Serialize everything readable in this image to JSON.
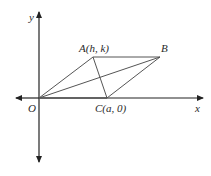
{
  "diagram": {
    "axes": {
      "x_label": "x",
      "y_label": "y",
      "origin": {
        "x": 39,
        "y": 98
      },
      "x_range": [
        16,
        203
      ],
      "y_range": [
        12,
        162
      ]
    },
    "points": {
      "O": {
        "label": "O",
        "x": 39,
        "y": 98
      },
      "A": {
        "label": "A(h, k)",
        "x": 93,
        "y": 57
      },
      "B": {
        "label": "B",
        "x": 160,
        "y": 57
      },
      "C": {
        "label": "C(a, 0)",
        "x": 107,
        "y": 98
      }
    },
    "segments": [
      [
        "O",
        "A"
      ],
      [
        "A",
        "B"
      ],
      [
        "B",
        "C"
      ],
      [
        "C",
        "O"
      ],
      [
        "O",
        "B"
      ],
      [
        "A",
        "C"
      ]
    ],
    "colors": {
      "axis": "#222222",
      "shape": "#555555",
      "text": "#2a2a2a"
    }
  }
}
